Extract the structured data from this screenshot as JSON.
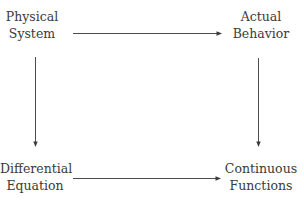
{
  "diagram": {
    "type": "commutative-diagram",
    "nodes": [
      {
        "id": "physical_system",
        "lines": [
          "Physical",
          "System"
        ],
        "position": "top-left"
      },
      {
        "id": "actual_behavior",
        "lines": [
          "Actual",
          "Behavior"
        ],
        "position": "top-right"
      },
      {
        "id": "differential_equation",
        "lines": [
          "Differential",
          "Equation"
        ],
        "position": "bottom-left"
      },
      {
        "id": "continuous_functions",
        "lines": [
          "Continuous",
          "Functions"
        ],
        "position": "bottom-right"
      }
    ],
    "edges": [
      {
        "from": "physical_system",
        "to": "actual_behavior",
        "direction": "right"
      },
      {
        "from": "physical_system",
        "to": "differential_equation",
        "direction": "down"
      },
      {
        "from": "actual_behavior",
        "to": "continuous_functions",
        "direction": "down"
      },
      {
        "from": "differential_equation",
        "to": "continuous_functions",
        "direction": "right"
      }
    ],
    "colors": {
      "line": "#3a3a3a",
      "text": "#3a3a3a",
      "background": "#ffffff"
    }
  }
}
